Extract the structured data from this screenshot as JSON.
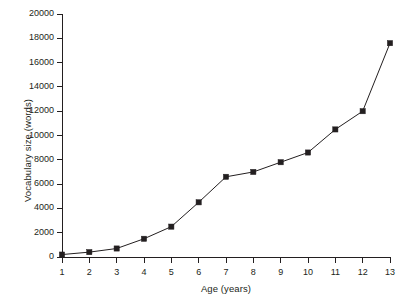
{
  "chart_data": {
    "type": "line",
    "title": "",
    "subtitle": "",
    "xlabel": "Age (years)",
    "ylabel": "Vocabulary size (words)",
    "x": [
      1,
      2,
      3,
      4,
      5,
      6,
      7,
      8,
      9,
      10,
      11,
      12,
      13
    ],
    "values": [
      200,
      400,
      700,
      1500,
      2500,
      4500,
      6600,
      7000,
      7800,
      8600,
      10500,
      12000,
      17600
    ],
    "series": [
      {
        "name": "Vocabulary size",
        "values": [
          200,
          400,
          700,
          1500,
          2500,
          4500,
          6600,
          7000,
          7800,
          8600,
          10500,
          12000,
          17600
        ]
      }
    ],
    "xlim": [
      1,
      13
    ],
    "ylim": [
      0,
      20000
    ],
    "xticks": [
      "1",
      "2",
      "3",
      "4",
      "5",
      "6",
      "7",
      "8",
      "9",
      "10",
      "11",
      "12",
      "13"
    ],
    "yticks": [
      "0",
      "2000",
      "4000",
      "6000",
      "8000",
      "10000",
      "12000",
      "14000",
      "16000",
      "18000",
      "20000"
    ],
    "ytick_values": [
      0,
      2000,
      4000,
      6000,
      8000,
      10000,
      12000,
      14000,
      16000,
      18000,
      20000
    ],
    "grid": false,
    "legend": false,
    "legend_position": "none",
    "marker": "square",
    "line_color": "#231f20",
    "marker_color": "#231f20",
    "background_color": "#ffffff"
  }
}
